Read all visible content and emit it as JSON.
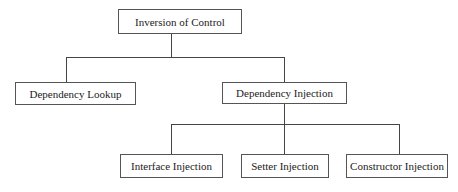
{
  "diagram": {
    "type": "hierarchy-tree",
    "root": {
      "id": "ioc",
      "label": "Inversion of Control"
    },
    "level1": [
      {
        "id": "lookup",
        "label": "Dependency Lookup"
      },
      {
        "id": "injection",
        "label": "Dependency Injection"
      }
    ],
    "level2": [
      {
        "id": "interface",
        "label": "Interface Injection",
        "parent": "injection"
      },
      {
        "id": "setter",
        "label": "Setter Injection",
        "parent": "injection"
      },
      {
        "id": "constructor",
        "label": "Constructor Injection",
        "parent": "injection"
      }
    ],
    "edges": [
      {
        "from": "ioc",
        "to": "lookup"
      },
      {
        "from": "ioc",
        "to": "injection"
      },
      {
        "from": "injection",
        "to": "interface"
      },
      {
        "from": "injection",
        "to": "setter"
      },
      {
        "from": "injection",
        "to": "constructor"
      }
    ]
  }
}
